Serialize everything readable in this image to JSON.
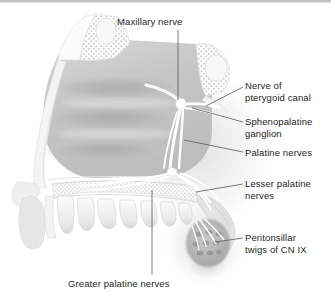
{
  "figure": {
    "style": "grayscale medical line-and-wash illustration, sagittal section",
    "background_color": "#ffffff",
    "ink_color": "#262626",
    "rule_color": "#c2c2c2"
  },
  "labels": {
    "maxillary_nerve": "Maxillary nerve",
    "nerve_of_pterygoid_canal": "Nerve of\npterygoid canal",
    "sphenopalatine_ganglion": "Sphenopalatine\nganglion",
    "palatine_nerves": "Palatine nerves",
    "lesser_palatine_nerves": "Lesser palatine\nnerves",
    "peritonsillar_twigs": "Peritonsillar\ntwigs of CN IX",
    "greater_palatine_nerves": "Greater palatine nerves"
  },
  "structures": [
    "frontal sinus",
    "frontal bone (cancellous stipple)",
    "superior turbinate",
    "middle turbinate",
    "inferior turbinate",
    "hard palate",
    "maxillary teeth",
    "upper lip",
    "soft palate",
    "palatine tonsil",
    "sphenoid sinus"
  ]
}
